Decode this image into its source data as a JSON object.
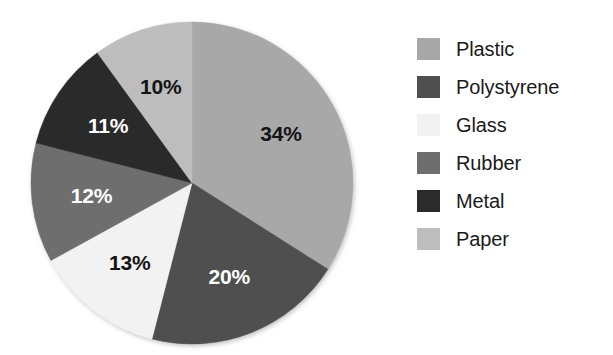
{
  "chart_data": {
    "type": "pie",
    "title": "",
    "subtitle": "",
    "xlabel": "",
    "ylabel": "",
    "grid": false,
    "legend_position": "right",
    "start_angle_deg": 0,
    "direction": "clockwise",
    "categories": [
      "Plastic",
      "Polystyrene",
      "Glass",
      "Rubber",
      "Metal",
      "Paper"
    ],
    "values": [
      34,
      20,
      13,
      12,
      11,
      10
    ],
    "units": "percent",
    "data_labels": [
      "34%",
      "20%",
      "13%",
      "12%",
      "11%",
      "10%"
    ],
    "slices": [
      {
        "label": "Plastic",
        "value": 34,
        "data_label": "34%",
        "color": "#a8a8a8",
        "label_color": "#141414"
      },
      {
        "label": "Polystyrene",
        "value": 20,
        "data_label": "20%",
        "color": "#4f4f4f",
        "label_color": "#ffffff"
      },
      {
        "label": "Glass",
        "value": 13,
        "data_label": "13%",
        "color": "#f2f2f2",
        "label_color": "#141414"
      },
      {
        "label": "Rubber",
        "value": 12,
        "data_label": "12%",
        "color": "#6e6e6e",
        "label_color": "#ffffff"
      },
      {
        "label": "Metal",
        "value": 11,
        "data_label": "11%",
        "color": "#2b2b2b",
        "label_color": "#ffffff"
      },
      {
        "label": "Paper",
        "value": 10,
        "data_label": "10%",
        "color": "#bdbdbd",
        "label_color": "#141414"
      }
    ]
  },
  "legend": {
    "items": [
      {
        "label": "Plastic",
        "color": "#a8a8a8"
      },
      {
        "label": "Polystyrene",
        "color": "#4f4f4f"
      },
      {
        "label": "Glass",
        "color": "#f2f2f2"
      },
      {
        "label": "Rubber",
        "color": "#6e6e6e"
      },
      {
        "label": "Metal",
        "color": "#2b2b2b"
      },
      {
        "label": "Paper",
        "color": "#bdbdbd"
      }
    ]
  },
  "geometry": {
    "center_x": 192,
    "center_y": 183,
    "radius": 161,
    "label_radius_ratio": 0.63
  }
}
